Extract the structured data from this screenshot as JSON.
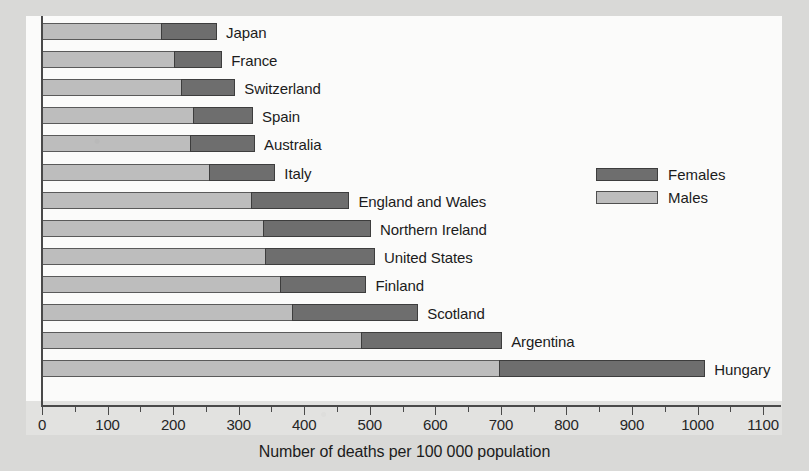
{
  "chart_data": {
    "type": "bar",
    "orientation": "horizontal",
    "stacked": true,
    "title": "",
    "xlabel": "Number of deaths per 100 000 population",
    "ylabel": "",
    "xlim": [
      0,
      1100
    ],
    "xticks": [
      0,
      100,
      200,
      300,
      400,
      500,
      600,
      700,
      800,
      900,
      1000,
      1100
    ],
    "xtick_labels": [
      "0",
      "100",
      "200",
      "300",
      "400",
      "500",
      "600",
      "700",
      "800",
      "900",
      "1000",
      "1100"
    ],
    "minor_tick_step": 50,
    "grid": false,
    "legend_position": "center-right",
    "categories": [
      "Japan",
      "France",
      "Switzerland",
      "Spain",
      "Australia",
      "Italy",
      "England and Wales",
      "Northern Ireland",
      "United States",
      "Finland",
      "Scotland",
      "Argentina",
      "Hungary"
    ],
    "series": [
      {
        "name": "Males",
        "color": "#bdbdbd",
        "values": [
          183,
          203,
          214,
          232,
          228,
          256,
          321,
          339,
          341,
          365,
          383,
          488,
          698
        ]
      },
      {
        "name": "Females",
        "color": "#6e6e6e",
        "values": [
          84,
          72,
          81,
          90,
          97,
          100,
          148,
          163,
          167,
          130,
          191,
          214,
          314
        ]
      }
    ],
    "totals": [
      267,
      275,
      295,
      322,
      325,
      356,
      469,
      502,
      508,
      495,
      574,
      702,
      1012
    ]
  },
  "legend": {
    "items": [
      {
        "label": "Females",
        "color": "#6e6e6e"
      },
      {
        "label": "Males",
        "color": "#bdbdbd"
      }
    ]
  },
  "colors": {
    "page_background": "#d9d9d7",
    "plot_background": "#fbfbfa",
    "axis": "#4a4a4a",
    "males": "#bdbdbd",
    "females": "#6e6e6e",
    "text": "#1c1c1c"
  }
}
